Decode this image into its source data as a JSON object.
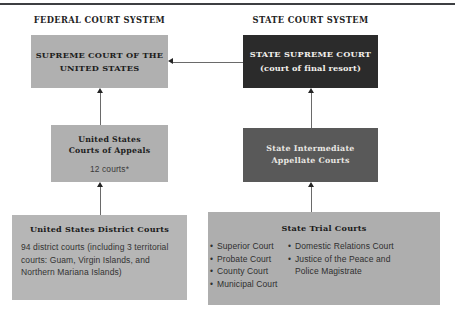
{
  "diagram": {
    "columns": {
      "federal_title": "FEDERAL COURT SYSTEM",
      "state_title": "STATE COURT SYSTEM"
    },
    "federal": {
      "supreme_court": {
        "heading_line1": "SUPREME COURT OF THE",
        "heading_line2": "UNITED STATES"
      },
      "courts_of_appeals": {
        "heading_line1": "United States",
        "heading_line2": "Courts of Appeals",
        "detail": "12 courts*"
      },
      "district_courts": {
        "heading": "United States District Courts",
        "detail": "94 district courts (including 3 territorial courts: Guam, Virgin Islands, and Northern Mariana Islands)"
      }
    },
    "state": {
      "supreme_court": {
        "heading_line1": "STATE SUPREME COURT",
        "heading_line2": "(court of final resort)"
      },
      "intermediate_appellate": {
        "heading_line1": "State Intermediate",
        "heading_line2": "Appellate Courts"
      },
      "trial_courts": {
        "heading": "State Trial Courts",
        "column_left": [
          "Superior Court",
          "Probate Court",
          "County Court",
          "Municipal Court"
        ],
        "column_right": [
          "Domestic Relations Court",
          "Justice of the Peace and",
          "Police Magistrate"
        ]
      }
    },
    "colors": {
      "federal_box": "#b0b0b0",
      "federal_district_box": "#b6b6b6",
      "state_supreme_box": "#2b2b2b",
      "state_appellate_box": "#595959",
      "state_trial_box": "#aeaeae",
      "connector": "#6a6a6a",
      "arrowhead": "#252525",
      "top_rule": "#3d3f42"
    }
  }
}
